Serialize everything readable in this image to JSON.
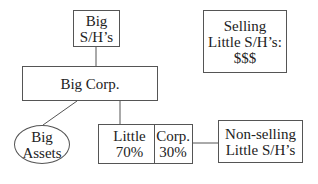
{
  "diagram": {
    "big_shareholders": {
      "line1": "Big",
      "line2": "S/H’s"
    },
    "big_corp": {
      "label": "Big Corp."
    },
    "big_assets": {
      "line1": "Big",
      "line2": "Assets"
    },
    "little_corp": {
      "left": {
        "line1": "Little",
        "line2": "70%"
      },
      "right": {
        "line1": "Corp.",
        "line2": "30%"
      }
    },
    "non_selling": {
      "line1": "Non-selling",
      "line2": "Little S/H’s"
    },
    "selling": {
      "line1": "Selling",
      "line2": "Little S/H’s:",
      "line3": "$$$"
    }
  }
}
